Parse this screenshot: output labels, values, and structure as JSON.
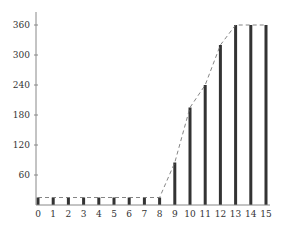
{
  "chart_data": {
    "type": "bar",
    "title": "",
    "xlabel": "",
    "ylabel": "",
    "categories": [
      "0",
      "1",
      "2",
      "3",
      "4",
      "5",
      "6",
      "7",
      "8",
      "9",
      "10",
      "11",
      "12",
      "13",
      "14",
      "15"
    ],
    "values": [
      15,
      15,
      15,
      15,
      15,
      15,
      15,
      15,
      15,
      85,
      195,
      240,
      320,
      360,
      360,
      360
    ],
    "ylim": [
      0,
      380
    ],
    "yticks": [
      60,
      120,
      180,
      240,
      300,
      360
    ],
    "grid": false,
    "legend": null,
    "overlay": {
      "type": "dashed-line",
      "connects": "bar-tops"
    },
    "colors": {
      "bar": "#333333",
      "axis": "#888888",
      "dash": "#777777"
    }
  }
}
